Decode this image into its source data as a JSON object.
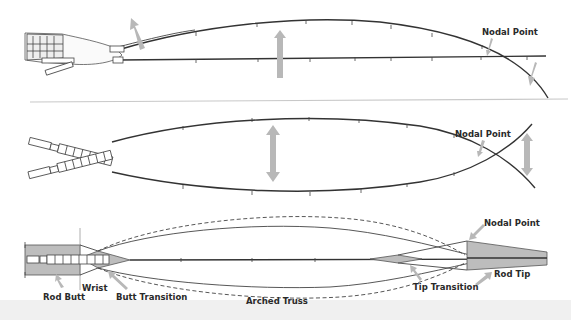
{
  "figure": {
    "panel_top": {
      "name": "casting-flex",
      "labels": {
        "nodal_point": "Nodal Point"
      }
    },
    "panel_middle": {
      "name": "oscillation",
      "labels": {
        "nodal_point": "Nodal Point"
      }
    },
    "panel_bottom": {
      "name": "arched-truss-schematic",
      "labels": {
        "nodal_point": "Nodal Point",
        "rod_butt": "Rod Butt",
        "wrist": "Wrist",
        "butt_transition": "Butt Transition",
        "arched_truss": "Arched Truss",
        "tip_transition": "Tip Transition",
        "rod_tip": "Rod Tip"
      }
    },
    "colors": {
      "line": "#333333",
      "arrow_grey": "#b8b8b8",
      "shade_grey": "#bdbdbd",
      "ground_line": "#c8c8c8"
    }
  }
}
